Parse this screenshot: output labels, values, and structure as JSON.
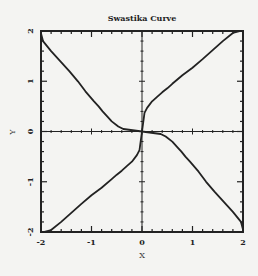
{
  "chart_data": {
    "type": "line",
    "title": "Swastika Curve",
    "xlabel": "X",
    "ylabel": "Y",
    "xlim": [
      -2,
      2
    ],
    "ylim": [
      -2,
      2
    ],
    "x_ticks": [
      -2,
      -1,
      0,
      1,
      2
    ],
    "y_ticks": [
      -2,
      -1,
      0,
      1,
      2
    ],
    "x_tick_labels": [
      "-2",
      "-1",
      "0",
      "1",
      "2"
    ],
    "y_tick_labels": [
      "-2",
      "-1",
      "0",
      "1",
      "2"
    ],
    "minor_ticks_per_major": 5,
    "grid": false,
    "legend": null,
    "zero_axes": true,
    "equation": "y^4 - x^4 = x*y",
    "series": [
      {
        "name": "branch-upper-right",
        "x": [
          0,
          0.05,
          0.1,
          0.2,
          0.3,
          0.4,
          0.5,
          0.6,
          0.8,
          1.0,
          1.2,
          1.4,
          1.6,
          1.8,
          1.95
        ],
        "y": [
          0,
          0.37,
          0.47,
          0.6,
          0.69,
          0.78,
          0.86,
          0.95,
          1.12,
          1.27,
          1.44,
          1.62,
          1.8,
          1.96,
          2.0
        ]
      },
      {
        "name": "branch-lower-left",
        "x": [
          0,
          -0.05,
          -0.1,
          -0.2,
          -0.3,
          -0.4,
          -0.5,
          -0.6,
          -0.8,
          -1.0,
          -1.2,
          -1.4,
          -1.6,
          -1.8,
          -1.95
        ],
        "y": [
          0,
          -0.37,
          -0.47,
          -0.6,
          -0.69,
          -0.78,
          -0.86,
          -0.95,
          -1.12,
          -1.27,
          -1.44,
          -1.62,
          -1.8,
          -1.96,
          -2.0
        ]
      },
      {
        "name": "branch-upper-left",
        "x": [
          0,
          -0.37,
          -0.47,
          -0.6,
          -0.69,
          -0.78,
          -0.86,
          -0.95,
          -1.12,
          -1.27,
          -1.44,
          -1.62,
          -1.8,
          -1.96,
          -2.0
        ],
        "y": [
          0,
          0.05,
          0.1,
          0.2,
          0.3,
          0.4,
          0.5,
          0.6,
          0.8,
          1.0,
          1.2,
          1.4,
          1.6,
          1.8,
          1.95
        ]
      },
      {
        "name": "branch-lower-right",
        "x": [
          0,
          0.37,
          0.47,
          0.6,
          0.69,
          0.78,
          0.86,
          0.95,
          1.12,
          1.27,
          1.44,
          1.62,
          1.8,
          1.96,
          2.0
        ],
        "y": [
          0,
          -0.05,
          -0.1,
          -0.2,
          -0.3,
          -0.4,
          -0.5,
          -0.6,
          -0.8,
          -1.0,
          -1.2,
          -1.4,
          -1.6,
          -1.8,
          -1.95
        ]
      }
    ]
  },
  "style": {
    "line_color": "#222222",
    "frame_color": "#222222",
    "background": "#f4f4f2"
  }
}
